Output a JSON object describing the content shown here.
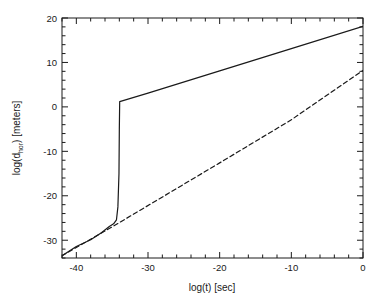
{
  "figure": {
    "background": "#ffffff",
    "frame_color": "#1a1a1a",
    "line_color": "#1a1a1a"
  },
  "axes": {
    "x_title": "log(t) [sec]",
    "y_title_main": "log(d",
    "y_title_sub": "hor",
    "y_title_tail": ") [meters]",
    "x_ticks": [
      "-40",
      "-30",
      "-20",
      "-10",
      "0"
    ],
    "y_ticks": [
      "20",
      "10",
      "0",
      "-10",
      "-20",
      "-30"
    ]
  },
  "chart_data": {
    "type": "line",
    "title": "",
    "xlabel": "log(t) [sec]",
    "ylabel": "log(d_hor) [meters]",
    "xlim": [
      -42,
      0
    ],
    "ylim": [
      -34,
      20
    ],
    "xticks": [
      -40,
      -30,
      -20,
      -10,
      0
    ],
    "yticks": [
      20,
      10,
      0,
      -10,
      -20,
      -30
    ],
    "xtick_labels": [
      "-40",
      "-30",
      "-20",
      "-10",
      "0"
    ],
    "ytick_labels": [
      "20",
      "10",
      "0",
      "-10",
      "-20",
      "-30"
    ],
    "minor_tick_interval_x": 2,
    "minor_tick_interval_y": 2,
    "grid": false,
    "legend": null,
    "series": [
      {
        "name": "inflationary horizon",
        "style": "solid",
        "color": "#1a1a1a",
        "points": [
          [
            -42.0,
            -33.5
          ],
          [
            -40.0,
            -31.4
          ],
          [
            -38.0,
            -29.9
          ],
          [
            -36.5,
            -28.3
          ],
          [
            -35.4,
            -26.9
          ],
          [
            -34.8,
            -26.3
          ],
          [
            -34.4,
            -25.4
          ],
          [
            -34.2,
            -22.5
          ],
          [
            -34.05,
            -15.0
          ],
          [
            -34.0,
            -5.0
          ],
          [
            -33.95,
            1.2
          ],
          [
            -30.0,
            3.1
          ],
          [
            -20.0,
            8.1
          ],
          [
            -10.0,
            13.1
          ],
          [
            0.0,
            18.1
          ]
        ]
      },
      {
        "name": "non-inflationary horizon",
        "style": "dashed",
        "color": "#1a1a1a",
        "points": [
          [
            -42.0,
            -33.5
          ],
          [
            -35.0,
            -27.0
          ],
          [
            -20.0,
            -12.6
          ],
          [
            -10.0,
            -2.9
          ],
          [
            0.0,
            8.2
          ]
        ]
      }
    ]
  }
}
